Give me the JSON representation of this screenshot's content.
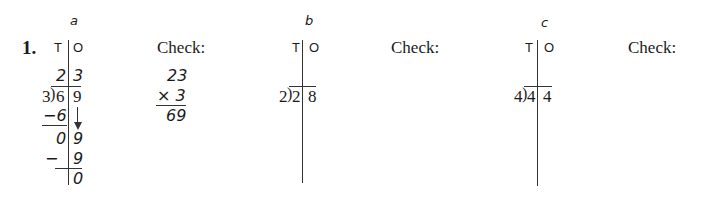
{
  "exercise": {
    "number": "1.",
    "check_label": "Check:",
    "column_headers": {
      "tens": "T",
      "ones": "O"
    }
  },
  "problems": [
    {
      "letter": "a",
      "divisor": "3",
      "dividend_tens": "6",
      "dividend_ones": "9",
      "quotient_tens": "2",
      "quotient_ones": "3",
      "steps": [
        {
          "tens": "−6",
          "ones": ""
        },
        {
          "tens": "0",
          "ones": "9"
        },
        {
          "tens": "−",
          "ones": "9"
        },
        {
          "tens": "",
          "ones": "0"
        }
      ],
      "check": {
        "line1": "23",
        "line2": "× 3",
        "result": "69"
      }
    },
    {
      "letter": "b",
      "divisor": "2",
      "dividend_tens": "2",
      "dividend_ones": "8"
    },
    {
      "letter": "c",
      "divisor": "4",
      "dividend_tens": "4",
      "dividend_ones": "4"
    }
  ]
}
